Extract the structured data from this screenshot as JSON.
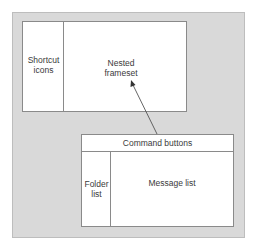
{
  "diagram": {
    "top_frameset": {
      "left_frame_label": "Shortcut\nicons",
      "right_frame_label": "Nested\nframeset"
    },
    "nested_frameset": {
      "top_frame_label": "Command buttons",
      "left_frame_label": "Folder\nlist",
      "right_frame_label": "Message list"
    },
    "arrow": {
      "from": "nested_frameset",
      "to": "top_frameset.right_frame"
    }
  }
}
